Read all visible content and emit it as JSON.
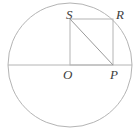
{
  "figure": {
    "kind": "geometry-diagram",
    "canvas": {
      "width": 138,
      "height": 133
    },
    "colors": {
      "background": "#ffffff",
      "stroke": "#b4b4b4",
      "diagonal_stroke": "#9a9a9a",
      "label": "#3d3d3d"
    },
    "circle": {
      "cx": 70,
      "cy": 65,
      "r": 62,
      "stroke_width": 1
    },
    "diameter": {
      "x1": 8,
      "y1": 65,
      "x2": 132,
      "y2": 65
    },
    "square": {
      "name": "OPRS",
      "x": 70,
      "y": 19,
      "width": 43,
      "height": 46,
      "stroke_width": 1
    },
    "diagonal": {
      "from": "S",
      "to": "P",
      "x1": 70,
      "y1": 19,
      "x2": 113,
      "y2": 65
    },
    "points": [
      {
        "id": "S",
        "label": "S",
        "x": 70,
        "y": 19
      },
      {
        "id": "R",
        "label": "R",
        "x": 113,
        "y": 19
      },
      {
        "id": "O",
        "label": "O",
        "x": 70,
        "y": 65
      },
      {
        "id": "P",
        "label": "P",
        "x": 113,
        "y": 65
      }
    ],
    "labels": {
      "S": "S",
      "R": "R",
      "O": "O",
      "P": "P"
    }
  }
}
